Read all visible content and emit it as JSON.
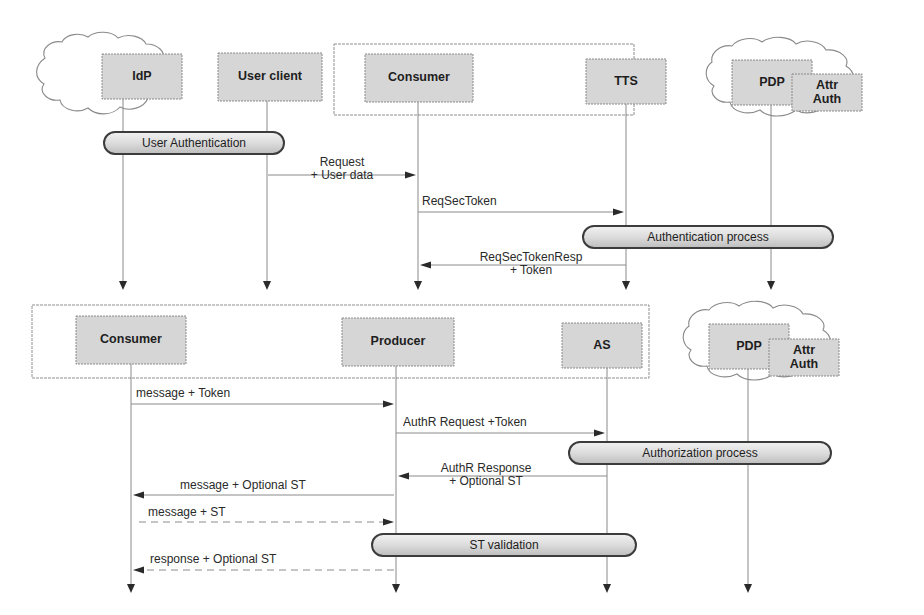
{
  "diagram": {
    "panels": [
      {
        "id": "authentication",
        "entities": [
          {
            "key": "idp",
            "label": "IdP",
            "x": 102,
            "y": 54,
            "w": 80,
            "h": 45,
            "lifeline_x": 123,
            "cloud": true
          },
          {
            "key": "user_client",
            "label": "User client",
            "x": 218,
            "y": 53,
            "w": 104,
            "h": 48,
            "lifeline_x": 267
          },
          {
            "key": "consumer",
            "label": "Consumer",
            "x": 365,
            "y": 54,
            "w": 108,
            "h": 48,
            "lifeline_x": 418
          },
          {
            "key": "tts",
            "label": "TTS",
            "x": 586,
            "y": 59,
            "w": 80,
            "h": 45,
            "lifeline_x": 626
          },
          {
            "key": "pdp",
            "label": "PDP",
            "x": 732,
            "y": 60,
            "w": 80,
            "h": 45,
            "lifeline_x": 771,
            "cloud": true
          },
          {
            "key": "attr_auth",
            "label": "Attr Auth",
            "label_lines": [
              "Attr",
              "Auth"
            ],
            "x": 792,
            "y": 74,
            "w": 70,
            "h": 37
          }
        ],
        "group_box": {
          "x": 334,
          "y": 44,
          "w": 300,
          "h": 71
        },
        "lifeline_end_y": 290,
        "processes": [
          {
            "label": "User Authentication",
            "x": 104,
            "y": 132,
            "w": 180,
            "h": 22
          },
          {
            "label": "Authentication process",
            "x": 583,
            "y": 226,
            "w": 250,
            "h": 22
          }
        ],
        "messages": [
          {
            "lines": [
              "Request",
              "+ User data"
            ],
            "from_x": 268,
            "to_x": 416,
            "y": 175,
            "dashed": false,
            "label_x": 342,
            "label_y": 166,
            "anchor": "middle"
          },
          {
            "lines": [
              "ReqSecToken"
            ],
            "from_x": 418,
            "to_x": 624,
            "y": 212,
            "dashed": false,
            "label_x": 422,
            "label_y": 205,
            "anchor": "start"
          },
          {
            "lines": [
              "ReqSecTokenResp",
              "+ Token"
            ],
            "from_x": 626,
            "to_x": 420,
            "y": 265,
            "dashed": false,
            "label_x": 531,
            "label_y": 261,
            "anchor": "middle"
          }
        ]
      },
      {
        "id": "authorization",
        "entities": [
          {
            "key": "consumer",
            "label": "Consumer",
            "x": 76,
            "y": 316,
            "w": 110,
            "h": 48,
            "lifeline_x": 131
          },
          {
            "key": "producer",
            "label": "Producer",
            "x": 342,
            "y": 318,
            "w": 112,
            "h": 48,
            "lifeline_x": 396
          },
          {
            "key": "as",
            "label": "AS",
            "x": 562,
            "y": 323,
            "w": 80,
            "h": 45,
            "lifeline_x": 607
          },
          {
            "key": "pdp",
            "label": "PDP",
            "x": 709,
            "y": 324,
            "w": 80,
            "h": 45,
            "lifeline_x": 748,
            "cloud": true
          },
          {
            "key": "attr_auth",
            "label": "Attr Auth",
            "label_lines": [
              "Attr",
              "Auth"
            ],
            "x": 769,
            "y": 339,
            "w": 70,
            "h": 37
          }
        ],
        "group_box": {
          "x": 32,
          "y": 305,
          "w": 617,
          "h": 73
        },
        "lifeline_end_y": 593,
        "processes": [
          {
            "label": "Authorization process",
            "x": 569,
            "y": 442,
            "w": 262,
            "h": 22
          },
          {
            "label": "ST validation",
            "x": 372,
            "y": 534,
            "w": 264,
            "h": 22
          }
        ],
        "messages": [
          {
            "lines": [
              "message + Token"
            ],
            "from_x": 131,
            "to_x": 394,
            "y": 404,
            "dashed": false,
            "label_x": 136,
            "label_y": 397,
            "anchor": "start"
          },
          {
            "lines": [
              "AuthR Request +Token"
            ],
            "from_x": 396,
            "to_x": 605,
            "y": 433,
            "dashed": false,
            "label_x": 403,
            "label_y": 426,
            "anchor": "start"
          },
          {
            "lines": [
              "AuthR Response",
              "+ Optional ST"
            ],
            "from_x": 607,
            "to_x": 398,
            "y": 476,
            "dashed": false,
            "label_x": 486,
            "label_y": 472,
            "anchor": "middle"
          },
          {
            "lines": [
              "message + Optional ST"
            ],
            "from_x": 394,
            "to_x": 133,
            "y": 495,
            "dashed": false,
            "label_x": 180,
            "label_y": 489,
            "anchor": "start"
          },
          {
            "lines": [
              "message + ST"
            ],
            "from_x": 139,
            "to_x": 394,
            "y": 522,
            "dashed": true,
            "label_x": 148,
            "label_y": 516,
            "anchor": "start"
          },
          {
            "lines": [
              "response + Optional ST"
            ],
            "from_x": 394,
            "to_x": 133,
            "y": 570,
            "dashed": true,
            "label_x": 150,
            "label_y": 563,
            "anchor": "start"
          }
        ]
      }
    ]
  }
}
